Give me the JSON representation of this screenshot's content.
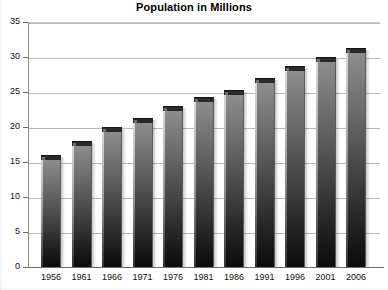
{
  "chart_data": {
    "type": "bar",
    "title": "Population in Millions",
    "xlabel": "",
    "ylabel": "",
    "categories": [
      "1956",
      "1961",
      "1966",
      "1971",
      "1976",
      "1981",
      "1986",
      "1991",
      "1996",
      "2001",
      "2006"
    ],
    "values": [
      16,
      18,
      20,
      21.3,
      23,
      24.3,
      25.3,
      27,
      28.7,
      30,
      31.3
    ],
    "ylim": [
      0,
      35
    ],
    "yticks": [
      0,
      5,
      10,
      15,
      20,
      25,
      30,
      35
    ],
    "ytick_labels": [
      "0",
      "5",
      "10",
      "15",
      "20",
      "25",
      "30",
      "35"
    ],
    "grid": true,
    "legend": false,
    "legend_position": "none",
    "series": [
      {
        "name": "Population in Millions",
        "values": [
          16,
          18,
          20,
          21.3,
          23,
          24.3,
          25.3,
          27,
          28.7,
          30,
          31.3
        ]
      }
    ],
    "colors": {
      "bar_top": "#8e8e8e",
      "bar_bottom": "#0c0c0c",
      "bar_cap": "#2a2a2a",
      "bar_highlight": "#d8d8d8",
      "gridline": "#b9b9b9",
      "axis": "#6b6b6b",
      "background": "#ffffff",
      "text": "#000000"
    }
  }
}
